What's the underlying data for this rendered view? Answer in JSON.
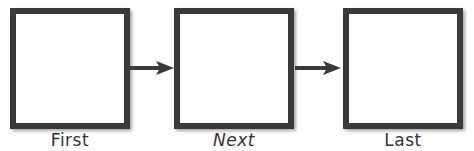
{
  "diagram": {
    "type": "sequence-flow",
    "boxes": [
      {
        "label": "First"
      },
      {
        "label": "Next"
      },
      {
        "label": "Last"
      }
    ],
    "arrows": [
      {
        "from": "First",
        "to": "Next"
      },
      {
        "from": "Next",
        "to": "Last"
      }
    ],
    "colors": {
      "border": "#3a3a3a",
      "fill": "#ffffff",
      "text": "#333333"
    }
  }
}
